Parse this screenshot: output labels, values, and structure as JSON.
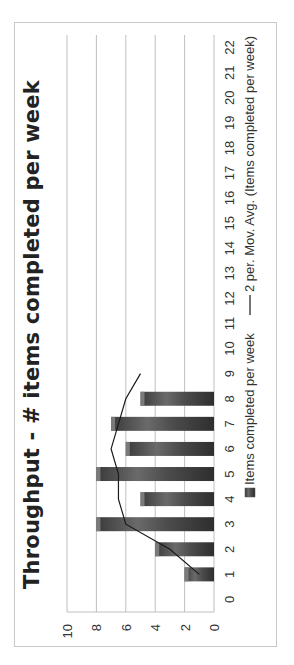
{
  "chart_data": {
    "type": "bar",
    "title": "Throughput - # items completed per week",
    "xlabel": "",
    "ylabel": "",
    "categories": [
      0,
      1,
      2,
      3,
      4,
      5,
      6,
      7,
      8,
      9,
      10,
      11,
      12,
      13,
      14,
      15,
      16,
      17,
      18,
      19,
      20,
      21,
      22
    ],
    "series": [
      {
        "name": "Items completed per week",
        "type": "bar",
        "x": [
          1,
          2,
          3,
          4,
          5,
          6,
          7,
          8
        ],
        "values": [
          2,
          4,
          8,
          5,
          8,
          6,
          7,
          5
        ]
      },
      {
        "name": "2 per. Mov. Avg. (Items completed per week)",
        "type": "line",
        "x": [
          1,
          2,
          3,
          4,
          5,
          6,
          7,
          8,
          9
        ],
        "values": [
          1,
          3,
          6,
          6.5,
          6.5,
          7,
          6.5,
          6,
          5
        ]
      }
    ],
    "ylim": [
      0,
      10
    ],
    "yticks": [
      0,
      2,
      4,
      6,
      8,
      10
    ],
    "grid": true,
    "legend_position": "bottom",
    "orientation_note": "image rotated 90 degrees counter-clockwise",
    "colors": {
      "bar": "#4a4a4a",
      "line": "#1a1a1a",
      "grid": "#bfbfbf"
    }
  }
}
